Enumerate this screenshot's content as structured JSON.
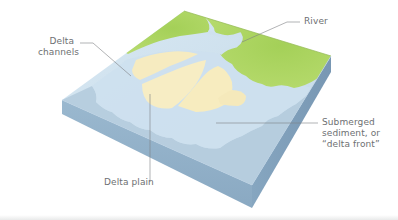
{
  "diagram": {
    "labels": {
      "delta_channels": [
        "Delta",
        "channels"
      ],
      "river": "River",
      "submerged_sediment": [
        "Submerged",
        "sediment, or",
        "“delta front”"
      ],
      "delta_plain": "Delta plain"
    },
    "colors": {
      "land": "#a6d25a",
      "land_light": "#c6e27e",
      "water_shallow": "#cfe3f0",
      "water_deep": "#a9c4d8",
      "sediment": "#f7ecbf",
      "block_front": "#8fafc8",
      "block_right": "#7f9fba",
      "leader_line": "#7d8083",
      "label_text": "#6d6f72"
    }
  }
}
